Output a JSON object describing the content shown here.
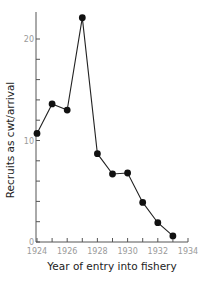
{
  "chart_data": {
    "type": "line",
    "title": "",
    "xlabel": "Year of entry into fishery",
    "ylabel": "Recruits as cwt/arrival",
    "x": [
      1924,
      1925,
      1926,
      1927,
      1928,
      1929,
      1930,
      1931,
      1932,
      1933
    ],
    "series": [
      {
        "name": "Recruits",
        "values": [
          10.7,
          13.6,
          13.0,
          22.1,
          8.7,
          6.7,
          6.8,
          3.9,
          1.9,
          0.6
        ]
      }
    ],
    "xlim": [
      1924,
      1934
    ],
    "ylim": [
      0,
      22.5
    ],
    "x_ticks": [
      1924,
      1925,
      1926,
      1927,
      1928,
      1929,
      1930,
      1931,
      1932,
      1933,
      1934
    ],
    "x_tick_labels": [
      "1924",
      "1926",
      "1928",
      "1930",
      "1932",
      "1934"
    ],
    "y_ticks": [
      0,
      2,
      4,
      6,
      8,
      10,
      12,
      14,
      16,
      18,
      20
    ],
    "y_tick_labels": [
      "0",
      "10",
      "20"
    ],
    "grid": false,
    "legend": null,
    "marker": "filled-circle",
    "color": "#111111"
  }
}
